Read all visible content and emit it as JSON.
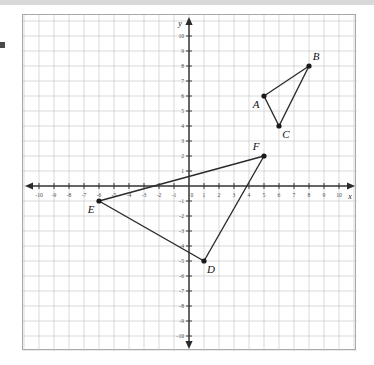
{
  "figure": {
    "kind": "coordinate-plane-two-triangles",
    "axis_labels": {
      "x": "x",
      "y": "y"
    },
    "x_range": [
      -10,
      10
    ],
    "y_range": [
      -10,
      10
    ],
    "x_ticks": [
      "-10",
      "-9",
      "-8",
      "-7",
      "-6",
      "-5",
      "-4",
      "-3",
      "-2",
      "-1",
      "0",
      "1",
      "2",
      "3",
      "4",
      "5",
      "6",
      "7",
      "8",
      "9",
      "10"
    ],
    "y_ticks": [
      "10",
      "9",
      "8",
      "7",
      "6",
      "5",
      "4",
      "3",
      "2",
      "1",
      "-1",
      "-2",
      "-3",
      "-4",
      "-5",
      "-6",
      "-7",
      "-8",
      "-9",
      "-10"
    ],
    "grid": true,
    "colors": {
      "grid": "#c9c9c9",
      "axis": "#3a3a3a",
      "segment": "#2b2b2b",
      "vertex": "#1a1a1a",
      "border": "#a8a8a8"
    }
  },
  "chart_data": {
    "type": "scatter",
    "title": "",
    "xlabel": "x",
    "ylabel": "y",
    "xlim": [
      -10,
      10
    ],
    "ylim": [
      -10,
      10
    ],
    "grid": true,
    "shapes": [
      {
        "name": "triangle-abc",
        "closed": true,
        "points": [
          {
            "label": "A",
            "x": 5,
            "y": 6,
            "label_pos": "below-left"
          },
          {
            "label": "B",
            "x": 8,
            "y": 8,
            "label_pos": "above-right"
          },
          {
            "label": "C",
            "x": 6,
            "y": 4,
            "label_pos": "below-right"
          }
        ]
      },
      {
        "name": "triangle-def",
        "closed": true,
        "points": [
          {
            "label": "D",
            "x": 1,
            "y": -5,
            "label_pos": "below-right"
          },
          {
            "label": "E",
            "x": -6,
            "y": -1,
            "label_pos": "below-left"
          },
          {
            "label": "F",
            "x": 5,
            "y": 2,
            "label_pos": "above-left"
          }
        ]
      }
    ]
  }
}
